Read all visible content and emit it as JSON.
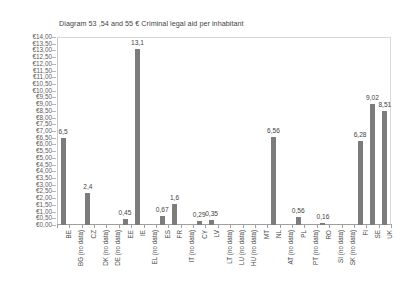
{
  "chart": {
    "title": "Diagram 53 ,54 and 55  € Criminal legal aid per inhabitant",
    "bar_color": "#7c7c7c"
  },
  "chart_data": {
    "type": "bar",
    "title": "Diagram 53 ,54 and 55  € Criminal legal aid per inhabitant",
    "xlabel": "",
    "ylabel": "",
    "ylim": [
      0,
      14
    ],
    "ytick_step": 0.5,
    "ytick_prefix": "€",
    "decimal_separator": ",",
    "grid": false,
    "legend": "none",
    "categories": [
      "BE",
      "BG (no data)",
      "CZ",
      "DK (no data)",
      "DE (no data)",
      "EE",
      "IE",
      "EL (no data)",
      "ES",
      "FR",
      "IT (no data)",
      "CY",
      "LV",
      "LT (no data)",
      "LU (no data)",
      "HU (no data)",
      "MT",
      "NL",
      "AT (no data)",
      "PL",
      "PT (no data)",
      "RO",
      "SI (no data)",
      "SK (no data)",
      "FI",
      "SE",
      "UK"
    ],
    "values": [
      6.5,
      null,
      2.4,
      null,
      null,
      0.45,
      13.1,
      null,
      0.67,
      1.6,
      null,
      0.29,
      0.35,
      null,
      null,
      null,
      null,
      6.56,
      null,
      0.56,
      null,
      0.16,
      null,
      null,
      6.28,
      9.02,
      8.51
    ],
    "data_labels": [
      "6,5",
      "",
      "2,4",
      "",
      "",
      "0,45",
      "13,1",
      "",
      "0,67",
      "1,6",
      "",
      "0,29",
      "0,35",
      "",
      "",
      "",
      "",
      "6,56",
      "",
      "0,56",
      "",
      "0,16",
      "",
      "",
      "6,28",
      "9,02",
      "8,51"
    ],
    "ytick_labels": [
      "€14,00",
      "€13,50",
      "€13,00",
      "€12,50",
      "€12,00",
      "€11,50",
      "€11,00",
      "€10,50",
      "€10,00",
      "€9,50",
      "€9,00",
      "€8,50",
      "€8,00",
      "€7,50",
      "€7,00",
      "€6,50",
      "€6,00",
      "€5,50",
      "€5,00",
      "€4,50",
      "€4,00",
      "€3,50",
      "€3,00",
      "€2,50",
      "€2,00",
      "€1,50",
      "€1,00",
      "€0,50",
      "€0,00"
    ]
  }
}
